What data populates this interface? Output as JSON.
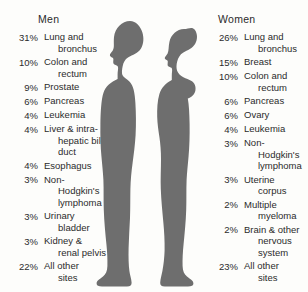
{
  "chart_data": {
    "type": "table",
    "colors": {
      "silhouette": "#6e6e6e",
      "text": "#2b2b2b",
      "background": "#fdfdfb"
    },
    "columns": [
      "Percent",
      "Site"
    ],
    "groups": [
      {
        "name": "Men",
        "heading": "Men",
        "figure": "male-silhouette",
        "rows": [
          {
            "pct": "31%",
            "value": 31,
            "site_line1": "Lung and",
            "site_line2": "bronchus"
          },
          {
            "pct": "10%",
            "value": 10,
            "site_line1": "Colon and",
            "site_line2": "rectum"
          },
          {
            "pct": "9%",
            "value": 9,
            "site_line1": "Prostate",
            "site_line2": ""
          },
          {
            "pct": "6%",
            "value": 6,
            "site_line1": "Pancreas",
            "site_line2": ""
          },
          {
            "pct": "4%",
            "value": 4,
            "site_line1": "Leukemia",
            "site_line2": ""
          },
          {
            "pct": "4%",
            "value": 4,
            "site_line1": "Liver & intra-",
            "site_line2": "hepatic bile",
            "site_line3": "duct"
          },
          {
            "pct": "4%",
            "value": 4,
            "site_line1": "Esophagus",
            "site_line2": ""
          },
          {
            "pct": "3%",
            "value": 3,
            "site_line1": "Non-",
            "site_line2": "Hodgkin's",
            "site_line3": "lymphoma"
          },
          {
            "pct": "3%",
            "value": 3,
            "site_line1": "Urinary",
            "site_line2": "bladder"
          },
          {
            "pct": "3%",
            "value": 3,
            "site_line1": "Kidney &",
            "site_line2": "renal pelvis"
          },
          {
            "pct": "22%",
            "value": 22,
            "site_line1": "All other",
            "site_line2": "sites"
          }
        ]
      },
      {
        "name": "Women",
        "heading": "Women",
        "figure": "female-silhouette",
        "rows": [
          {
            "pct": "26%",
            "value": 26,
            "site_line1": "Lung and",
            "site_line2": "bronchus"
          },
          {
            "pct": "15%",
            "value": 15,
            "site_line1": "Breast",
            "site_line2": ""
          },
          {
            "pct": "10%",
            "value": 10,
            "site_line1": "Colon and",
            "site_line2": "rectum"
          },
          {
            "pct": "6%",
            "value": 6,
            "site_line1": "Pancreas",
            "site_line2": ""
          },
          {
            "pct": "6%",
            "value": 6,
            "site_line1": "Ovary",
            "site_line2": ""
          },
          {
            "pct": "4%",
            "value": 4,
            "site_line1": "Leukemia",
            "site_line2": ""
          },
          {
            "pct": "3%",
            "value": 3,
            "site_line1": "Non-",
            "site_line2": "Hodgkin's",
            "site_line3": "lymphoma"
          },
          {
            "pct": "3%",
            "value": 3,
            "site_line1": "Uterine",
            "site_line2": "corpus"
          },
          {
            "pct": "2%",
            "value": 2,
            "site_line1": "Multiple",
            "site_line2": "myeloma"
          },
          {
            "pct": "2%",
            "value": 2,
            "site_line1": "Brain & other",
            "site_line2": "nervous",
            "site_line3": "system"
          },
          {
            "pct": "23%",
            "value": 23,
            "site_line1": "All other",
            "site_line2": "sites"
          }
        ]
      }
    ]
  }
}
